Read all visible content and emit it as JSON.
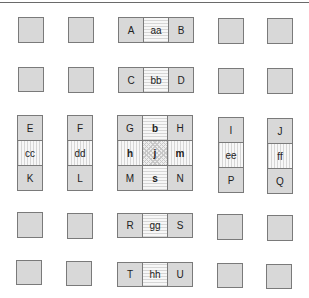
{
  "grid": {
    "row1": {
      "left": "A",
      "mid": "aa",
      "right": "B"
    },
    "row2": {
      "left": "C",
      "mid": "bb",
      "right": "D"
    },
    "row3": {
      "col1": {
        "top": "E",
        "mid": "cc",
        "bottom": "K"
      },
      "col2": {
        "top": "F",
        "mid": "dd",
        "bottom": "L"
      },
      "center": {
        "r1": [
          "G",
          "b",
          "H"
        ],
        "r2": [
          "h",
          "j",
          "m"
        ],
        "r3": [
          "M",
          "s",
          "N"
        ]
      },
      "col4": {
        "top": "I",
        "mid": "ee",
        "bottom": "P"
      },
      "col5": {
        "top": "J",
        "mid": "ff",
        "bottom": "Q"
      }
    },
    "row4": {
      "left": "R",
      "mid": "gg",
      "right": "S"
    },
    "row5": {
      "left": "T",
      "mid": "hh",
      "right": "U"
    }
  },
  "colors": {
    "solid_fill": "#d8d8d8",
    "border": "#7a7a7a",
    "pattern_line": "#d6d6d6"
  }
}
